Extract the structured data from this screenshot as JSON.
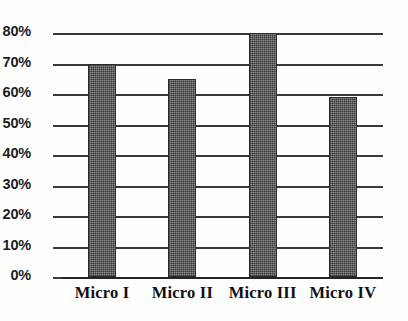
{
  "chart_data": {
    "type": "bar",
    "title": "",
    "subtitle": "",
    "xlabel": "",
    "ylabel": "",
    "categories": [
      "Micro I",
      "Micro II",
      "Micro III",
      "Micro IV"
    ],
    "values": [
      70,
      65,
      80,
      59
    ],
    "value_unit": "%",
    "ylim": [
      0,
      80
    ],
    "ytick_step": 10,
    "ytick_labels": [
      "0%",
      "10%",
      "20%",
      "30%",
      "40%",
      "50%",
      "60%",
      "70%",
      "80%"
    ],
    "ytick_values": [
      0,
      10,
      20,
      30,
      40,
      50,
      60,
      70,
      80
    ],
    "grid": true,
    "grid_axis": "y",
    "legend": false,
    "legend_position": "none",
    "bar_color": "#6f6f6f",
    "bar_edge_color": "#2a2a2a",
    "grid_color": "#3a3a3a",
    "axis_color": "#262626",
    "background_color": "#ffffff",
    "text_color": "#1c1c1c"
  }
}
